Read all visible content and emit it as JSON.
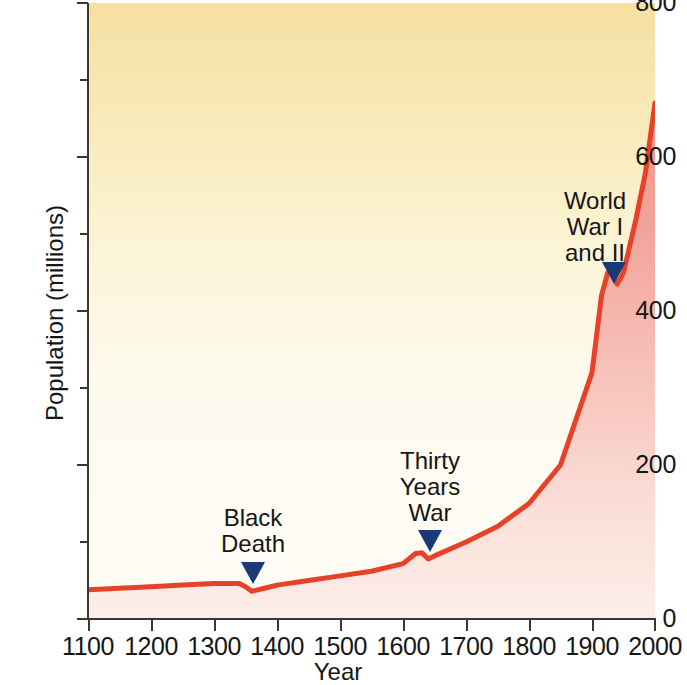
{
  "chart_data": {
    "type": "area",
    "title": "",
    "xlabel": "Year",
    "ylabel": "Population (millions)",
    "xlim": [
      1100,
      2000
    ],
    "ylim": [
      0,
      800
    ],
    "grid": false,
    "legend": "none",
    "x_major_ticks": [
      1100,
      1200,
      1300,
      1400,
      1500,
      1600,
      1700,
      1800,
      1900,
      2000
    ],
    "x_tick_labels": [
      "1100",
      "1200",
      "1300",
      "1400",
      "1500",
      "1600",
      "1700",
      "1800",
      "1900",
      "2000"
    ],
    "y_major_ticks": [
      0,
      200,
      400,
      600,
      800
    ],
    "y_tick_labels": [
      "0",
      "200",
      "400",
      "600",
      "800"
    ],
    "y_minor_ticks": [
      100,
      300,
      500,
      700
    ],
    "series": [
      {
        "name": "World population",
        "color": "#e8412a",
        "x": [
          1100,
          1150,
          1200,
          1250,
          1300,
          1340,
          1350,
          1360,
          1380,
          1400,
          1450,
          1500,
          1550,
          1600,
          1620,
          1630,
          1640,
          1650,
          1700,
          1750,
          1800,
          1850,
          1900,
          1915,
          1925,
          1930,
          1940,
          1950,
          1970,
          1985,
          2000
        ],
        "values": [
          38,
          40,
          42,
          44,
          46,
          46,
          42,
          36,
          40,
          44,
          50,
          56,
          62,
          72,
          85,
          86,
          78,
          82,
          100,
          120,
          150,
          200,
          320,
          420,
          450,
          452,
          435,
          450,
          520,
          580,
          670
        ]
      }
    ],
    "annotations": [
      {
        "id": "black-death",
        "label": "Black\nDeath",
        "x": 1350,
        "y": 36,
        "marker": "down-triangle",
        "marker_color": "#1b3a75"
      },
      {
        "id": "thirty-years-war",
        "label": "Thirty\nYears\nWar",
        "x": 1635,
        "y": 78,
        "marker": "down-triangle",
        "marker_color": "#1b3a75"
      },
      {
        "id": "world-wars",
        "label": "World\nWar I\nand II",
        "x": 1930,
        "y": 440,
        "marker": "down-triangle",
        "marker_color": "#1b3a75"
      }
    ],
    "colors": {
      "line": "#e8412a",
      "fill_under_curve_top": "#f3a39c",
      "fill_under_curve_bottom": "#fbe7e2",
      "background_top": "#f7e5a8",
      "background_bottom": "#fdfbf0",
      "axis": "#3a3632",
      "marker": "#1b3a75",
      "text": "#161616"
    }
  }
}
